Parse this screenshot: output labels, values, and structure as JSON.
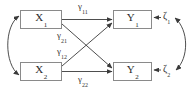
{
  "diagram": {
    "type": "path-diagram",
    "background_color": "#ffffff",
    "box_border_color": "#8a8a8a",
    "line_color": "#3a3a3a",
    "text_color": "#2b2b2b",
    "nodes": [
      {
        "id": "x1",
        "base": "X",
        "subscript": "1",
        "x": 20,
        "y": 10,
        "w": 42,
        "h": 19
      },
      {
        "id": "x2",
        "base": "X",
        "subscript": "2",
        "x": 20,
        "y": 62,
        "w": 42,
        "h": 19
      },
      {
        "id": "y1",
        "base": "Y",
        "subscript": "1",
        "x": 113,
        "y": 10,
        "w": 39,
        "h": 19
      },
      {
        "id": "y2",
        "base": "Y",
        "subscript": "2",
        "x": 113,
        "y": 62,
        "w": 39,
        "h": 19
      }
    ],
    "path_labels": [
      {
        "id": "g11",
        "base": "γ",
        "subscript": "11",
        "x": 78,
        "y": 2
      },
      {
        "id": "g21",
        "base": "γ",
        "subscript": "21",
        "x": 57,
        "y": 31
      },
      {
        "id": "g12",
        "base": "γ",
        "subscript": "12",
        "x": 57,
        "y": 47
      },
      {
        "id": "g22",
        "base": "γ",
        "subscript": "22",
        "x": 78,
        "y": 75
      }
    ],
    "disturbances": [
      {
        "id": "z1",
        "base": "ζ",
        "subscript": "1",
        "x": 163,
        "y": 11
      },
      {
        "id": "z2",
        "base": "ζ",
        "subscript": "2",
        "x": 163,
        "y": 64
      }
    ],
    "correlations": [
      {
        "id": "x-covariance",
        "between": [
          "x1",
          "x2"
        ],
        "style": "double-headed-curve",
        "side": "left"
      },
      {
        "id": "z-covariance",
        "between": [
          "z1",
          "z2"
        ],
        "style": "double-headed-curve",
        "side": "right"
      }
    ]
  }
}
